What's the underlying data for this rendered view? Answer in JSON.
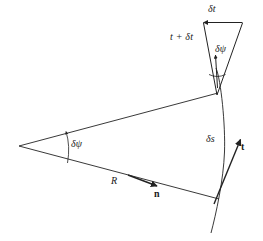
{
  "figure": {
    "stroke_color": "#222222",
    "background_color": "#ffffff"
  },
  "labels": {
    "delta_t": "δt",
    "t_plus_delta_t": "t + δt",
    "delta_psi_top": "δψ",
    "delta_psi_main": "δψ",
    "delta_s": "δs",
    "tangent": "t",
    "normal": "n",
    "radius": "R"
  },
  "geometry": {
    "center_vertex": {
      "x": 19,
      "y": 146
    },
    "arc_top_point": {
      "x": 218,
      "y": 93
    },
    "arc_bottom_point": {
      "x": 219,
      "y": 199
    },
    "tangent_arrow_tip": {
      "x": 241,
      "y": 139
    },
    "normal_arrow_tip": {
      "x": 157,
      "y": 186
    },
    "delta_psi_arc_x": 67,
    "triangle_apex": {
      "x": 217,
      "y": 95
    },
    "triangle_top_left": {
      "x": 203,
      "y": 22
    },
    "triangle_top_right": {
      "x": 243,
      "y": 22
    },
    "radius_length_px": 200,
    "subtended_angle_deg": 30
  }
}
